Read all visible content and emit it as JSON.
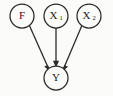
{
  "figure": {
    "type": "directed-acyclic-graph",
    "title": "",
    "background_color": "#fbfbfa",
    "stroke_color": "#2b2b2b",
    "node_fill_color": "#fbfbfa"
  },
  "nodes": [
    {
      "id": "F",
      "label": "F",
      "subscript": "",
      "cx": 22,
      "cy": 16,
      "r": 12,
      "role": "parent"
    },
    {
      "id": "X1",
      "label": "X",
      "subscript": "1",
      "cx": 56,
      "cy": 16,
      "r": 12,
      "role": "parent"
    },
    {
      "id": "X2",
      "label": "X",
      "subscript": "2",
      "cx": 89,
      "cy": 16,
      "r": 12,
      "role": "parent"
    },
    {
      "id": "Y",
      "label": "Y",
      "subscript": "",
      "cx": 56,
      "cy": 78,
      "r": 12,
      "role": "outcome"
    }
  ],
  "edges": [
    {
      "id": "F-to-Y",
      "from": "F",
      "to": "Y",
      "directed": true,
      "x1": 29.4,
      "y1": 25.4,
      "x2": 48.2,
      "y2": 68.6
    },
    {
      "id": "X1-to-Y",
      "from": "X1",
      "to": "Y",
      "directed": true,
      "x1": 56,
      "y1": 28,
      "x2": 56,
      "y2": 66
    },
    {
      "id": "X2-to-Y",
      "from": "X2",
      "to": "Y",
      "directed": true,
      "x1": 81.9,
      "y1": 25.6,
      "x2": 64.0,
      "y2": 68.4
    }
  ]
}
